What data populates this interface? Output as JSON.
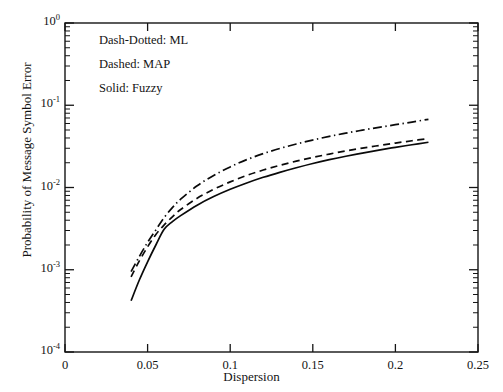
{
  "chart_data": {
    "type": "line",
    "title": "",
    "xlabel": "Dispersion",
    "ylabel": "Probability of Message Symbol Error",
    "xscale": "linear",
    "yscale": "log",
    "xlim": [
      0,
      0.25
    ],
    "ylim": [
      0.0001,
      1
    ],
    "grid": false,
    "legend_position": "upper-left-inside",
    "xticks": [
      "0",
      "0.05",
      "0.1",
      "0.15",
      "0.2",
      "0.25"
    ],
    "xtick_values": [
      0,
      0.05,
      0.1,
      0.15,
      0.2,
      0.25
    ],
    "yticks": [
      "10^0",
      "10^-1",
      "10^-2",
      "10^-3",
      "10^-4"
    ],
    "ytick_values": [
      1,
      0.1,
      0.01,
      0.001,
      0.0001
    ],
    "ytick_mantissa": "10",
    "ytick_exponents": [
      "0",
      "-1",
      "-2",
      "-3",
      "-4"
    ],
    "series": [
      {
        "name": "ML",
        "style": "dash-dotted",
        "legend_text": "Dash-Dotted: ML",
        "x": [
          0.04,
          0.045,
          0.05,
          0.055,
          0.06,
          0.065,
          0.07,
          0.08,
          0.09,
          0.1,
          0.11,
          0.12,
          0.13,
          0.14,
          0.15,
          0.16,
          0.17,
          0.18,
          0.19,
          0.2,
          0.21,
          0.22
        ],
        "y": [
          0.00095,
          0.00145,
          0.00215,
          0.00305,
          0.0043,
          0.0057,
          0.0072,
          0.0105,
          0.014,
          0.0178,
          0.0218,
          0.0258,
          0.0298,
          0.0338,
          0.0378,
          0.0418,
          0.0458,
          0.0498,
          0.0538,
          0.058,
          0.0625,
          0.0675
        ]
      },
      {
        "name": "MAP",
        "style": "dashed",
        "legend_text": "Dashed: MAP",
        "x": [
          0.04,
          0.045,
          0.05,
          0.055,
          0.06,
          0.065,
          0.07,
          0.08,
          0.09,
          0.1,
          0.11,
          0.12,
          0.13,
          0.14,
          0.15,
          0.16,
          0.17,
          0.18,
          0.19,
          0.2,
          0.21,
          0.22
        ],
        "y": [
          0.00082,
          0.00128,
          0.0019,
          0.00268,
          0.0035,
          0.0044,
          0.0054,
          0.0074,
          0.0095,
          0.0117,
          0.014,
          0.0163,
          0.0186,
          0.0209,
          0.0232,
          0.0255,
          0.0278,
          0.0301,
          0.0324,
          0.0347,
          0.037,
          0.0393
        ]
      },
      {
        "name": "Fuzzy",
        "style": "solid",
        "legend_text": "Solid: Fuzzy",
        "x": [
          0.04,
          0.045,
          0.05,
          0.055,
          0.06,
          0.065,
          0.07,
          0.08,
          0.09,
          0.1,
          0.11,
          0.12,
          0.13,
          0.14,
          0.15,
          0.16,
          0.17,
          0.18,
          0.19,
          0.2,
          0.21,
          0.22
        ],
        "y": [
          0.00042,
          0.00075,
          0.00125,
          0.002,
          0.0031,
          0.00385,
          0.00455,
          0.0061,
          0.00775,
          0.0095,
          0.01135,
          0.0133,
          0.0153,
          0.0174,
          0.0196,
          0.0218,
          0.024,
          0.0262,
          0.0285,
          0.0308,
          0.0331,
          0.0355
        ]
      }
    ],
    "annotations": [
      "Dash-Dotted: ML",
      "Dashed: MAP",
      "Solid: Fuzzy"
    ]
  },
  "legend": {
    "line1": "Dash-Dotted: ML",
    "line2": "Dashed: MAP",
    "line3": "Solid: Fuzzy"
  },
  "axes": {
    "x_title": "Dispersion",
    "y_title": "Probability of Message Symbol Error"
  },
  "colors": {
    "background": "#ffffff",
    "ink": "#111111",
    "axis": "#151515"
  }
}
